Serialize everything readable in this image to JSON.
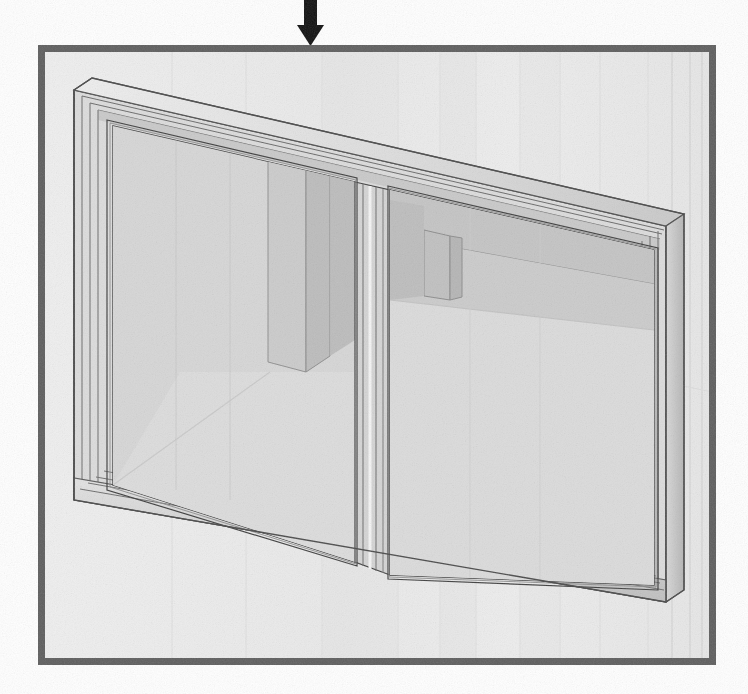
{
  "figure": {
    "canvas": {
      "width": 748,
      "height": 694,
      "background_color": "#ffffff"
    }
  },
  "annotation_arrow": {
    "name": "down-arrow",
    "direction": "down",
    "color": "#111111",
    "shaft": {
      "x": 304,
      "y_top": 0,
      "width": 13,
      "y_bottom": 28
    },
    "head": {
      "cx": 310,
      "y_top": 26,
      "half_width": 13,
      "y_tip": 46
    },
    "points_at": "panel-top-border"
  },
  "panel": {
    "name": "callout-panel",
    "border_color": "#5e5e5e",
    "border_width": 7,
    "fill_color": "#f1f1f1",
    "x": 38,
    "y": 45,
    "width": 678,
    "height": 620
  },
  "background_wall": {
    "fill_color": "#ededed",
    "panel_line_color": "#dcdcdc",
    "vertical_seam_x": [
      172,
      246,
      322,
      398,
      440,
      476,
      520,
      560,
      600,
      648,
      672,
      690,
      702
    ],
    "floor_line_color": "#d2d2d2"
  },
  "window_unit": {
    "name": "glazed-window-assembly",
    "projection": "isometric",
    "frame": {
      "outer_color": "#d7d7d7",
      "outer_shadow_color": "#b7b7b7",
      "edge_line_color": "#4a4a4a",
      "top_face_color": "#e4e4e4",
      "right_face_color": "#c4c4c4",
      "bottom_face_color": "#cfcfcf",
      "outline_width": 1.2,
      "outer_top_left": [
        72,
        86
      ],
      "outer_top_right": [
        666,
        222
      ],
      "outer_bottom_right": [
        666,
        600
      ],
      "outer_bottom_left": [
        72,
        500
      ],
      "depth_x": 18,
      "depth_y": -10
    },
    "mullion": {
      "name": "center-mullion",
      "top": [
        358,
        160
      ],
      "bottom": [
        380,
        575
      ],
      "width": 26,
      "color": "#d0d0d0",
      "highlight_color": "#f4f4f4",
      "line_color": "#555555"
    },
    "panes": [
      {
        "name": "left-glass-pane",
        "label": "Pane 1 (left)",
        "glass_color": "#d2d2d2",
        "glass_opacity": 0.72,
        "reflection": "interior column and floor"
      },
      {
        "name": "right-glass-pane",
        "label": "Pane 2 (right)",
        "glass_color": "#d4d4d4",
        "glass_opacity": 0.72,
        "reflection": "interior wall corner, soffit and floor"
      }
    ]
  },
  "reflected_interior": {
    "name": "interior-reflection",
    "column": {
      "name": "reflected-column",
      "fill_front": "#c8c8c8",
      "fill_side": "#b9b9b9",
      "outline": "#8d8d8d",
      "x": 268,
      "y_top": 150,
      "width": 58,
      "y_bottom": 372
    },
    "soffit": {
      "fill": "#c0c0c0",
      "outline": "#909090"
    },
    "back_wall": {
      "fill": "#cecece"
    },
    "floor": {
      "fill": "#dadada",
      "seam_color": "#bdbdbd"
    },
    "far_corner_post": {
      "fill": "#bcbcbc",
      "outline": "#8a8a8a"
    }
  },
  "palette": {
    "white": "#ffffff",
    "panel_fill": "#f1f1f1",
    "panel_border": "#5e5e5e",
    "glass_light": "#d8d8d8",
    "glass_mid": "#cacaca",
    "glass_dark": "#bdbdbd",
    "frame_light": "#e6e6e6",
    "frame_mid": "#d0d0d0",
    "frame_dark": "#a9a9a9",
    "line_dark": "#3f3f3f",
    "arrow": "#111111"
  }
}
